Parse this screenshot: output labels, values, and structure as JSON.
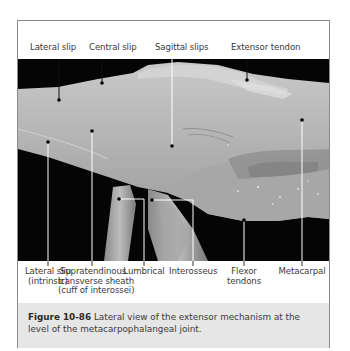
{
  "figure": {
    "top_labels": [
      {
        "text": "Lateral slip",
        "x": 42
      },
      {
        "text": "Central slip",
        "x": 86
      },
      {
        "text": "Sagittal slips",
        "x": 172
      },
      {
        "text": "Extensor tendon",
        "x": 246
      }
    ],
    "bottom_labels": [
      {
        "line1": "Lateral slip",
        "line2": "(intrinsic)",
        "line3": ""
      },
      {
        "line1": "Supratendinous",
        "line2": "transverse sheath",
        "line3": "(cuff of interossei)"
      },
      {
        "line1": "Lumbrical",
        "line2": "",
        "line3": ""
      },
      {
        "line1": "Interosseus",
        "line2": "",
        "line3": ""
      },
      {
        "line1": "Flexor",
        "line2": "tendons",
        "line3": ""
      },
      {
        "line1": "Metacarpal",
        "line2": "",
        "line3": ""
      }
    ],
    "caption": {
      "number": "Figure 10-86",
      "text": " Lateral view of the extensor mechanism at the level of the metacarpophalangeal joint."
    }
  }
}
